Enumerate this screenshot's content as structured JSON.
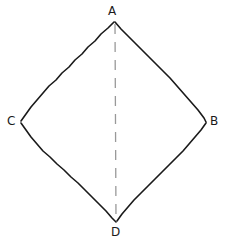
{
  "figure": {
    "background_color": "#ffffff",
    "stroke_color": "#1a1a1a",
    "diagonal_color": "#999999",
    "width": 225,
    "height": 242
  },
  "vertices": [
    {
      "id": "A",
      "label": "A",
      "x": 114,
      "y": 21
    },
    {
      "id": "B",
      "label": "B",
      "x": 206,
      "y": 122
    },
    {
      "id": "C",
      "label": "C",
      "x": 20,
      "y": 122
    },
    {
      "id": "D",
      "label": "D",
      "x": 116,
      "y": 222
    }
  ],
  "edges": [
    {
      "id": "AC",
      "from": "A",
      "to": "C",
      "style": "solid"
    },
    {
      "id": "AB",
      "from": "A",
      "to": "B",
      "style": "solid"
    },
    {
      "id": "CD",
      "from": "C",
      "to": "D",
      "style": "solid"
    },
    {
      "id": "BD",
      "from": "B",
      "to": "D",
      "style": "solid"
    }
  ],
  "diagonals": [
    {
      "id": "AD",
      "from": "A",
      "to": "D",
      "style": "dashed"
    }
  ]
}
